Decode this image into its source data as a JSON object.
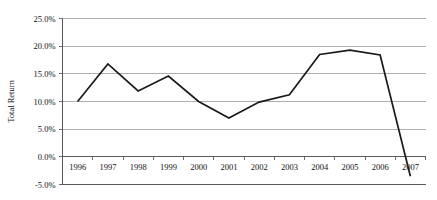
{
  "chart_data": {
    "type": "line",
    "title": "",
    "xlabel": "",
    "ylabel": "Total Return",
    "x": [
      1996,
      1997,
      1998,
      1999,
      2000,
      2001,
      2002,
      2003,
      2004,
      2005,
      2006,
      2007
    ],
    "categories": [
      "1996",
      "1997",
      "1998",
      "1999",
      "2000",
      "2001",
      "2002",
      "2003",
      "2004",
      "2005",
      "2006",
      "2007"
    ],
    "values": [
      10.0,
      16.8,
      11.9,
      14.6,
      10.0,
      7.0,
      9.9,
      11.2,
      18.5,
      19.3,
      18.4,
      -3.5
    ],
    "series": [
      {
        "name": "Total Return",
        "values": [
          10.0,
          16.8,
          11.9,
          14.6,
          10.0,
          7.0,
          9.9,
          11.2,
          18.5,
          19.3,
          18.4,
          -3.5
        ]
      }
    ],
    "ylim": [
      -5.0,
      25.0
    ],
    "yticks": [
      25.0,
      20.0,
      15.0,
      10.0,
      5.0,
      0.0,
      -5.0
    ],
    "ytick_labels": [
      "25.0%",
      "20.0%",
      "15.0%",
      "10.0%",
      "5.0%",
      "0.0%",
      "-5.0%"
    ],
    "grid": true,
    "legend": "none",
    "line_color": "#1a1a1a",
    "grid_color": "#9a9a9a",
    "axis_color": "#5a5a5a",
    "background_color": "#ffffff"
  }
}
